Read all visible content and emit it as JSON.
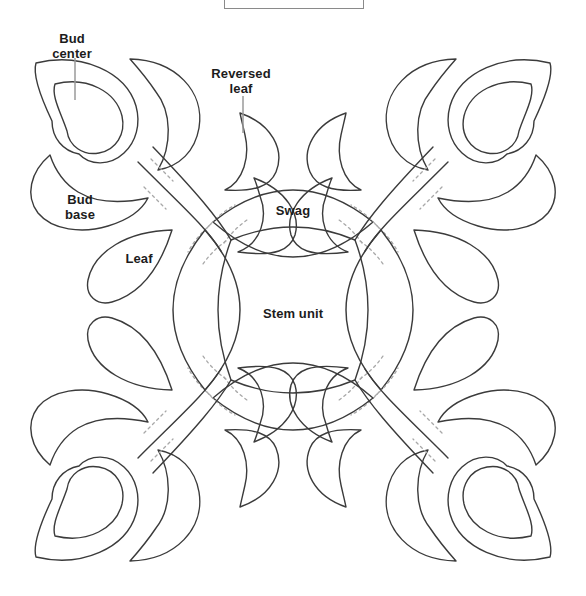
{
  "figure": {
    "type": "applique-quilt-block-pattern",
    "labels": {
      "bud_center": {
        "line1": "Bud",
        "line2": "center"
      },
      "reversed_leaf": {
        "line1": "Reversed",
        "line2": "leaf"
      },
      "bud_base": {
        "line1": "Bud",
        "line2": "base"
      },
      "leaf": {
        "text": "Leaf"
      },
      "swag": {
        "text": "Swag"
      },
      "stem_unit": {
        "text": "Stem unit"
      }
    },
    "colors": {
      "line": "#3b3b3b",
      "dash": "#a8a8a8",
      "pointer": "#9a9a9a",
      "text": "#1c1c1c",
      "box_border": "#8a8a8a",
      "background": "#ffffff"
    }
  }
}
